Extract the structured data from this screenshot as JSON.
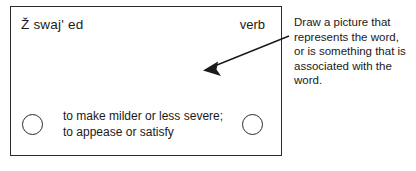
{
  "card": {
    "word": "Ž swaj' ed",
    "part_of_speech": "verb",
    "definition": "to make milder or less severe;\nto appease or satisfy",
    "bullet_left": "circle-bullet-left",
    "bullet_right": "circle-bullet-right",
    "drawing_area_label": "drawing-area"
  },
  "annotation": {
    "instruction": "Draw a picture that represents the word, or is something that is associated with the word.",
    "arrow": "arrow-pointing-left"
  },
  "colors": {
    "ink": "#2b2b2b",
    "text": "#1a1a1a",
    "background": "#ffffff"
  }
}
